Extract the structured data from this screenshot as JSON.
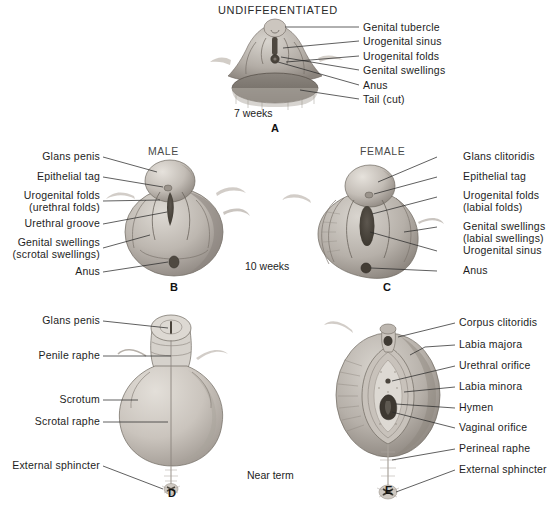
{
  "figure": {
    "title": "UNDIFFERENTIATED",
    "colors": {
      "ink": "#1d1d1d",
      "leader": "#2b2b2b",
      "section_heading": "#4a4a4a",
      "tissue_light": "#cfcac4",
      "tissue_mid": "#a9a39c",
      "tissue_dark": "#7d766f",
      "tissue_darkest": "#565049",
      "background": "#ffffff"
    }
  },
  "panels": [
    {
      "id": "A",
      "letter": "A",
      "heading": "UNDIFFERENTIATED",
      "stage": "7 weeks",
      "labels": [
        {
          "text": "Genital tubercle"
        },
        {
          "text": "Urogenital sinus"
        },
        {
          "text": "Urogenital folds"
        },
        {
          "text": "Genital swellings"
        },
        {
          "text": "Anus"
        },
        {
          "text": "Tail (cut)"
        }
      ]
    },
    {
      "id": "B",
      "letter": "B",
      "heading": "MALE",
      "stage": "10 weeks",
      "labels": [
        {
          "text": "Glans penis",
          "sub": ""
        },
        {
          "text": "Epithelial tag",
          "sub": ""
        },
        {
          "text": "Urogenital folds",
          "sub": "(urethral folds)"
        },
        {
          "text": "Urethral groove",
          "sub": ""
        },
        {
          "text": "Genital swellings",
          "sub": "(scrotal swellings)"
        },
        {
          "text": "Anus",
          "sub": ""
        }
      ]
    },
    {
      "id": "C",
      "letter": "C",
      "heading": "FEMALE",
      "stage": "10 weeks",
      "labels": [
        {
          "text": "Glans clitoridis",
          "sub": ""
        },
        {
          "text": "Epithelial tag",
          "sub": ""
        },
        {
          "text": "Urogenital folds",
          "sub": "(labial folds)"
        },
        {
          "text": "Genital swellings",
          "sub": "(labial swellings)"
        },
        {
          "text": "Urogenital sinus",
          "sub": ""
        },
        {
          "text": "Anus",
          "sub": ""
        }
      ]
    },
    {
      "id": "D",
      "letter": "D",
      "heading": "",
      "stage": "Near term",
      "labels": [
        {
          "text": "Glans penis"
        },
        {
          "text": "Penile raphe"
        },
        {
          "text": "Scrotum"
        },
        {
          "text": "Scrotal raphe"
        },
        {
          "text": "External sphincter"
        }
      ]
    },
    {
      "id": "E",
      "letter": "E",
      "heading": "",
      "stage": "Near term",
      "labels": [
        {
          "text": "Corpus clitoridis"
        },
        {
          "text": "Labia majora"
        },
        {
          "text": "Urethral orifice"
        },
        {
          "text": "Labia minora"
        },
        {
          "text": "Hymen"
        },
        {
          "text": "Vaginal orifice"
        },
        {
          "text": "Perineal raphe"
        },
        {
          "text": "External sphincter"
        }
      ]
    }
  ],
  "stages": {
    "row1": "7 weeks",
    "row2": "10 weeks",
    "row3": "Near term"
  }
}
